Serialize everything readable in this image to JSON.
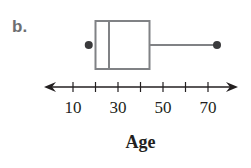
{
  "problem_label": "b.",
  "chart_data": {
    "type": "boxplot",
    "title": "",
    "xlabel": "Age",
    "ylabel": "",
    "xlim": [
      0,
      80
    ],
    "ticks": [
      10,
      20,
      30,
      40,
      50,
      60,
      70
    ],
    "tick_labels": [
      "10",
      "30",
      "50",
      "70"
    ],
    "box": {
      "min": 17,
      "q1": 20,
      "median": 26,
      "q3": 44,
      "max": 74
    },
    "grid": false,
    "legend": null
  },
  "colors": {
    "box_stroke": "#808285",
    "axis": "#231f20",
    "dot": "#3a3a3c",
    "label": "#6d6e71"
  }
}
